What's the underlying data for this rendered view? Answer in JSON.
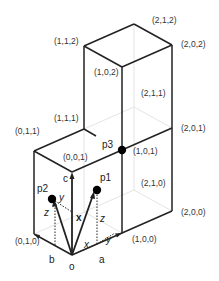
{
  "diagram": {
    "title": "",
    "vertex_labels": {
      "v112": "(1,1,2)",
      "v212": "(2,1,2)",
      "v202": "(2,0,2)",
      "v102": "(1,0,2)",
      "v211": "(2,1,1)",
      "v111": "(1,1,1)",
      "v011": "(0,1,1)",
      "v001": "(0,0,1)",
      "v101": "(1,0,1)",
      "v201": "(2,0,1)",
      "v210": "(2,1,0)",
      "v010": "(0,1,0)",
      "v200": "(2,0,0)",
      "v100": "(1,0,0)"
    },
    "axis_labels": {
      "a": "a",
      "b": "b",
      "c": "c",
      "origin": "o"
    },
    "point_labels": {
      "p1": "p1",
      "p2": "p2",
      "p3": "p3"
    },
    "vector_label": "x",
    "component_labels": {
      "p1_x": "x",
      "p1_y": "y",
      "p1_z": "z",
      "p2_y": "y",
      "p2_z": "z"
    },
    "colors": {
      "edge": "#222222",
      "hidden_edge": "#dddddd",
      "text": "#333333"
    }
  }
}
